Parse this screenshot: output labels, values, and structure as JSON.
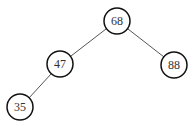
{
  "diagram": {
    "type": "binary-tree",
    "nodes": [
      {
        "id": "n68",
        "label": "68",
        "cx": 117,
        "cy": 21
      },
      {
        "id": "n47",
        "label": "47",
        "cx": 60,
        "cy": 64
      },
      {
        "id": "n88",
        "label": "88",
        "cx": 174,
        "cy": 65
      },
      {
        "id": "n35",
        "label": "35",
        "cx": 20,
        "cy": 107
      }
    ],
    "edges": [
      {
        "from": "n68",
        "to": "n47"
      },
      {
        "from": "n68",
        "to": "n88"
      },
      {
        "from": "n47",
        "to": "n35"
      }
    ],
    "radius": 13,
    "colors": {
      "stroke": "#111111",
      "edge": "#555555",
      "text": "#333333"
    }
  }
}
